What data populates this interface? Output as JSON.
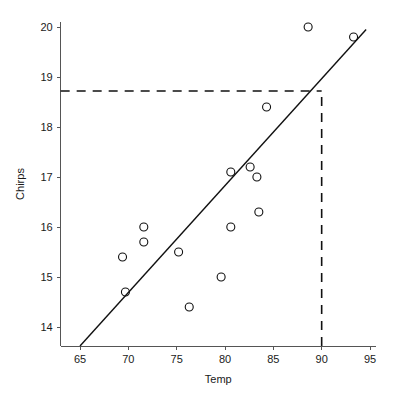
{
  "chart_data": {
    "type": "scatter",
    "title": "",
    "xlabel": "Temp",
    "ylabel": "Chirps",
    "xlim": [
      63.0,
      95.6
    ],
    "ylim": [
      13.62,
      20.1
    ],
    "grid": false,
    "legend": "none",
    "x_ticks": [
      65,
      70,
      75,
      80,
      85,
      90,
      95
    ],
    "y_ticks": [
      14,
      15,
      16,
      17,
      18,
      19,
      20
    ],
    "x_tick_labels": [
      "65",
      "70",
      "75",
      "80",
      "85",
      "90",
      "95"
    ],
    "y_tick_labels": [
      "14",
      "15",
      "16",
      "17",
      "18",
      "19",
      "20"
    ],
    "points": [
      {
        "x": 69.4,
        "y": 15.4
      },
      {
        "x": 69.7,
        "y": 14.7
      },
      {
        "x": 71.6,
        "y": 16.0
      },
      {
        "x": 71.6,
        "y": 15.7
      },
      {
        "x": 75.2,
        "y": 15.5
      },
      {
        "x": 76.3,
        "y": 14.4
      },
      {
        "x": 79.6,
        "y": 15.0
      },
      {
        "x": 80.6,
        "y": 16.0
      },
      {
        "x": 80.6,
        "y": 17.1
      },
      {
        "x": 82.6,
        "y": 17.2
      },
      {
        "x": 83.3,
        "y": 17.0
      },
      {
        "x": 83.5,
        "y": 16.3
      },
      {
        "x": 84.3,
        "y": 18.4
      },
      {
        "x": 88.6,
        "y": 20.0
      },
      {
        "x": 93.3,
        "y": 19.8
      }
    ],
    "marker": {
      "shape": "circle-open",
      "size": 4,
      "color": "#111111"
    },
    "fit_line": {
      "label": "regression line",
      "x_start": 65.0,
      "y_start": 13.62,
      "x_end": 94.6,
      "y_end": 19.95,
      "color": "#111111"
    },
    "guides": [
      {
        "name": "horizontal-prediction-guide",
        "orientation": "horizontal",
        "y": 18.72,
        "x_from": 63.0,
        "x_to": 90.0,
        "style": "dashed"
      },
      {
        "name": "vertical-prediction-guide",
        "orientation": "vertical",
        "x": 90.0,
        "y_from": 13.62,
        "y_to": 18.72,
        "style": "dashed"
      }
    ],
    "prediction": {
      "x": 90.0,
      "y": 18.72
    }
  }
}
